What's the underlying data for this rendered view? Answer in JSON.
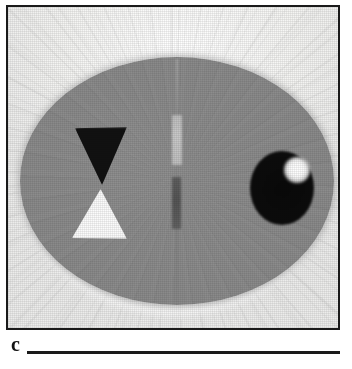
{
  "figure": {
    "panel_label": "c",
    "modality": "reconstructed cross-sectional image"
  },
  "frame": {
    "border_color": "#1a1a1a",
    "background_color": "#f2f2f0"
  },
  "scene": {
    "background_label": "background-field",
    "phantom_label": "elliptical-phantom",
    "phantom_color": "#8a8a8a",
    "background_color": "#f4f4f2"
  },
  "inclusions": [
    {
      "name": "triangle-dark",
      "shape": "triangle",
      "orientation": "pointing-down",
      "intensity": "dark",
      "color": "#111111"
    },
    {
      "name": "triangle-light",
      "shape": "triangle",
      "orientation": "pointing-up",
      "intensity": "bright",
      "color": "#fbfbfb"
    },
    {
      "name": "bar-light",
      "shape": "vertical-bar",
      "orientation": "vertical",
      "intensity": "light-grey",
      "color": "#c9c9c9"
    },
    {
      "name": "bar-dark",
      "shape": "vertical-bar",
      "orientation": "vertical",
      "intensity": "dark-grey",
      "color": "#585858"
    },
    {
      "name": "circle-dark",
      "shape": "circle",
      "orientation": "none",
      "intensity": "dark",
      "color": "#0c0c0c"
    },
    {
      "name": "circle-highlight",
      "shape": "circle",
      "orientation": "none",
      "intensity": "bright",
      "color": "#ffffff"
    }
  ],
  "artifacts": {
    "name": "radial-streak-artifacts",
    "visible": "yes"
  },
  "caption": {
    "rule_color": "#1a1a1a"
  }
}
